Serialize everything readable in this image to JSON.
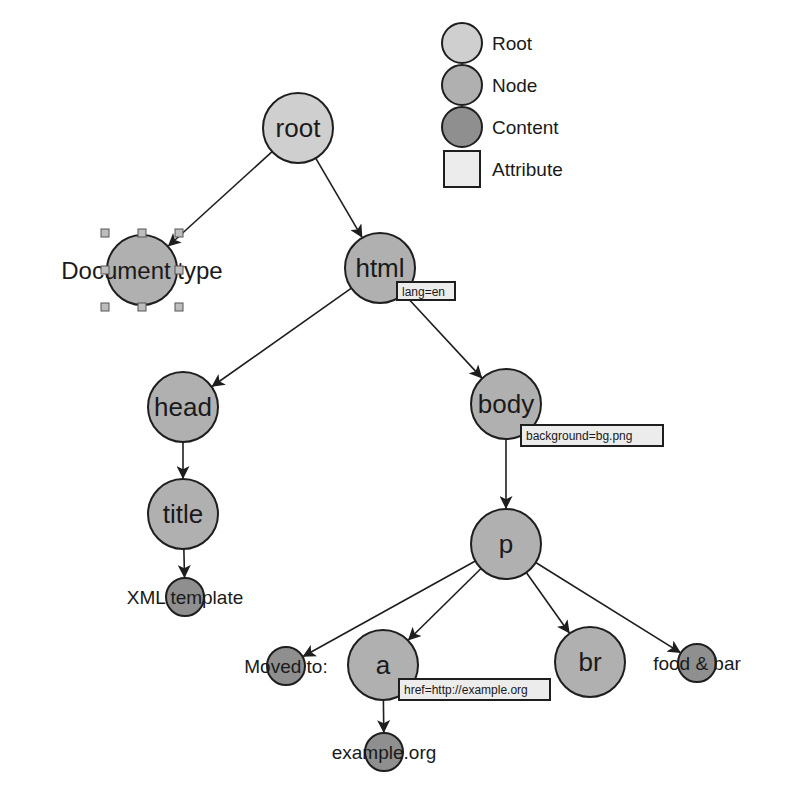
{
  "colors": {
    "root": "#cfcfcf",
    "node": "#b0b0b0",
    "content": "#8f8f8f",
    "attribute": "#ececec",
    "stroke": "#1e1e1e",
    "handle": "#bdbdbd"
  },
  "legend": {
    "items": [
      {
        "label": "Root",
        "kind": "root"
      },
      {
        "label": "Node",
        "kind": "node"
      },
      {
        "label": "Content",
        "kind": "content"
      },
      {
        "label": "Attribute",
        "kind": "attribute"
      }
    ]
  },
  "nodes": [
    {
      "id": "root",
      "label": "root",
      "kind": "root",
      "x": 298,
      "y": 128,
      "r": 35,
      "fs": 26
    },
    {
      "id": "doctype",
      "label": "Document type",
      "kind": "node",
      "x": 142,
      "y": 270,
      "r": 35,
      "fs": 24,
      "selected": true
    },
    {
      "id": "html",
      "label": "html",
      "kind": "node",
      "x": 380,
      "y": 268,
      "r": 35,
      "fs": 26
    },
    {
      "id": "head",
      "label": "head",
      "kind": "node",
      "x": 183,
      "y": 407,
      "r": 35,
      "fs": 26
    },
    {
      "id": "body",
      "label": "body",
      "kind": "node",
      "x": 506,
      "y": 404,
      "r": 35,
      "fs": 26
    },
    {
      "id": "title",
      "label": "title",
      "kind": "node",
      "x": 183,
      "y": 514,
      "r": 35,
      "fs": 26
    },
    {
      "id": "xmltemplate",
      "label": "XML template",
      "kind": "content",
      "x": 185,
      "y": 597,
      "r": 19,
      "fs": 19
    },
    {
      "id": "p",
      "label": "p",
      "kind": "node",
      "x": 506,
      "y": 544,
      "r": 35,
      "fs": 26
    },
    {
      "id": "movedto",
      "label": "Moved to:",
      "kind": "content",
      "x": 286,
      "y": 666,
      "r": 19,
      "fs": 19
    },
    {
      "id": "a",
      "label": "a",
      "kind": "node",
      "x": 383,
      "y": 665,
      "r": 35,
      "fs": 26
    },
    {
      "id": "br",
      "label": "br",
      "kind": "node",
      "x": 590,
      "y": 662,
      "r": 35,
      "fs": 26
    },
    {
      "id": "foodbar",
      "label": "food & bar",
      "kind": "content",
      "x": 697,
      "y": 663,
      "r": 19,
      "fs": 19
    },
    {
      "id": "exampleorg",
      "label": "example.org",
      "kind": "content",
      "x": 384,
      "y": 752,
      "r": 19,
      "fs": 19
    }
  ],
  "edges": [
    {
      "from": "root",
      "to": "doctype"
    },
    {
      "from": "root",
      "to": "html"
    },
    {
      "from": "html",
      "to": "head"
    },
    {
      "from": "html",
      "to": "body"
    },
    {
      "from": "head",
      "to": "title"
    },
    {
      "from": "title",
      "to": "xmltemplate"
    },
    {
      "from": "body",
      "to": "p"
    },
    {
      "from": "p",
      "to": "movedto"
    },
    {
      "from": "p",
      "to": "a"
    },
    {
      "from": "p",
      "to": "br"
    },
    {
      "from": "p",
      "to": "foodbar"
    },
    {
      "from": "a",
      "to": "exampleorg"
    }
  ],
  "attributes": [
    {
      "owner": "html",
      "text": "lang=en",
      "x": 397,
      "y": 282,
      "w": 58,
      "h": 18
    },
    {
      "owner": "body",
      "text": "background=bg.png",
      "x": 521,
      "y": 425,
      "w": 142,
      "h": 21
    },
    {
      "owner": "a",
      "text": "href=http://example.org",
      "x": 399,
      "y": 679,
      "w": 151,
      "h": 21
    }
  ]
}
